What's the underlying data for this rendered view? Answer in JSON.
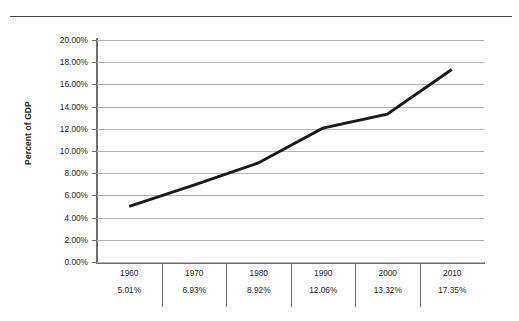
{
  "chart_data": {
    "type": "line",
    "title": "",
    "xlabel": "",
    "ylabel": "Percent of GDP",
    "categories": [
      "1960",
      "1970",
      "1980",
      "1990",
      "2000",
      "2010"
    ],
    "values": [
      5.01,
      6.93,
      8.92,
      12.06,
      13.32,
      17.35
    ],
    "value_labels": [
      "5.01%",
      "6.93%",
      "8.92%",
      "12.06%",
      "13.32%",
      "17.35%"
    ],
    "ylim": [
      0,
      20
    ],
    "ytick_step": 2,
    "ytick_labels": [
      "20.00%",
      "18.00%",
      "16.00%",
      "14.00%",
      "12.00%",
      "10.00%",
      "8.00%",
      "6.00%",
      "4.00%",
      "2.00%",
      "0.00%"
    ],
    "ytick_values": [
      20,
      18,
      16,
      14,
      12,
      10,
      8,
      6,
      4,
      2,
      0
    ],
    "grid": true,
    "legend": false,
    "legend_position": "none",
    "series": [
      {
        "name": "Percent of GDP",
        "values": [
          5.01,
          6.93,
          8.92,
          12.06,
          13.32,
          17.35
        ]
      }
    ],
    "colors": {
      "line": "#1a1a1a",
      "gridline": "#b4b4b4",
      "axis": "#6e6e6e",
      "text": "#231f20",
      "background": "#ffffff",
      "top_rule": "#4a4a4a"
    },
    "line_width_px": 3
  }
}
